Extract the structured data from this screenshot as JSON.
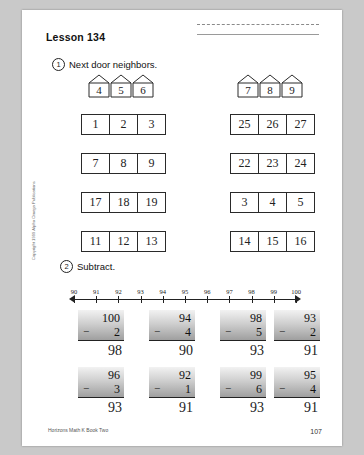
{
  "page": {
    "lesson_title": "Lesson 134",
    "page_number": "107",
    "footer_credit": "Horizons Math K Book Two",
    "side_credit": "Copyright 1999 Alpha Omega Publications"
  },
  "problem1": {
    "number": "1",
    "instruction": "Next door neighbors.",
    "houses_left": [
      "4",
      "5",
      "6"
    ],
    "houses_right": [
      "7",
      "8",
      "9"
    ],
    "rows_left": [
      [
        "1",
        "2",
        "3"
      ],
      [
        "7",
        "8",
        "9"
      ],
      [
        "17",
        "18",
        "19"
      ],
      [
        "11",
        "12",
        "13"
      ]
    ],
    "rows_right": [
      [
        "25",
        "26",
        "27"
      ],
      [
        "22",
        "23",
        "24"
      ],
      [
        "3",
        "4",
        "5"
      ],
      [
        "14",
        "15",
        "16"
      ]
    ]
  },
  "problem2": {
    "number": "2",
    "instruction": "Subtract.",
    "numberline": {
      "ticks": [
        "90",
        "91",
        "92",
        "93",
        "94",
        "95",
        "96",
        "97",
        "98",
        "99",
        "100"
      ]
    },
    "exercises": [
      {
        "top": "100",
        "bottom": "2",
        "operator": "−",
        "answer": "98"
      },
      {
        "top": "94",
        "bottom": "4",
        "operator": "−",
        "answer": "90"
      },
      {
        "top": "98",
        "bottom": "5",
        "operator": "−",
        "answer": "93"
      },
      {
        "top": "93",
        "bottom": "2",
        "operator": "−",
        "answer": "91"
      },
      {
        "top": "96",
        "bottom": "3",
        "operator": "−",
        "answer": "93"
      },
      {
        "top": "92",
        "bottom": "1",
        "operator": "−",
        "answer": "91"
      },
      {
        "top": "99",
        "bottom": "6",
        "operator": "−",
        "answer": "93"
      },
      {
        "top": "95",
        "bottom": "4",
        "operator": "−",
        "answer": "91"
      }
    ]
  }
}
